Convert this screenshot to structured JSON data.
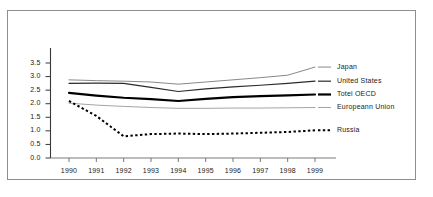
{
  "chart_data": {
    "type": "line",
    "title": "",
    "xlabel": "",
    "ylabel": "",
    "x": [
      1990,
      1991,
      1992,
      1993,
      1994,
      1995,
      1996,
      1997,
      1998,
      1999
    ],
    "categories": [
      "1990",
      "1991",
      "1992",
      "1993",
      "1994",
      "1995",
      "1996",
      "1997",
      "1998",
      "1999"
    ],
    "ylim": [
      0.0,
      3.75
    ],
    "yticks": [
      "0.0",
      "0.5",
      "1.0",
      "1.5",
      "2.0",
      "2.5",
      "3.0",
      "3.5"
    ],
    "ytick_values": [
      0.0,
      0.5,
      1.0,
      1.5,
      2.0,
      2.5,
      3.0,
      3.5
    ],
    "grid": false,
    "legend_position": "right",
    "series": [
      {
        "name": "Japan",
        "style": "thin-line",
        "color": "#7a7a7a",
        "values": [
          2.88,
          2.85,
          2.83,
          2.8,
          2.72,
          2.8,
          2.88,
          2.96,
          3.05,
          3.35
        ]
      },
      {
        "name": "United States",
        "style": "medium-line",
        "color": "#2b2b2b",
        "values": [
          2.75,
          2.76,
          2.75,
          2.6,
          2.45,
          2.55,
          2.62,
          2.68,
          2.75,
          2.83
        ]
      },
      {
        "name": "Totel OECD",
        "style": "thick-line",
        "color": "#000000",
        "values": [
          2.4,
          2.3,
          2.22,
          2.17,
          2.1,
          2.18,
          2.24,
          2.28,
          2.31,
          2.34
        ]
      },
      {
        "name": "Europeann Union",
        "style": "thin-line",
        "color": "#9a9a9a",
        "values": [
          2.02,
          1.95,
          1.9,
          1.86,
          1.83,
          1.83,
          1.84,
          1.84,
          1.85,
          1.86
        ]
      },
      {
        "name": "Russia",
        "style": "dotted-line",
        "color": "#000000",
        "values": [
          2.1,
          1.55,
          0.8,
          0.88,
          0.9,
          0.88,
          0.9,
          0.93,
          0.96,
          1.02
        ]
      }
    ]
  },
  "legend": {
    "entries": [
      {
        "label": "Japan"
      },
      {
        "label": "United States"
      },
      {
        "label": "Totel OECD"
      },
      {
        "label": "Europeann Union"
      },
      {
        "label": "Russia"
      }
    ]
  }
}
